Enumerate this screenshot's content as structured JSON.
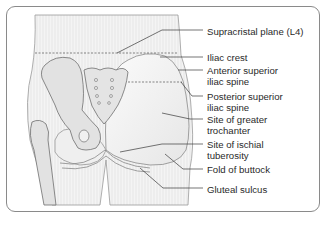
{
  "figure": {
    "labels": [
      {
        "id": "supracristal-plane",
        "lines": [
          "Supracristal plane (L4)"
        ]
      },
      {
        "id": "iliac-crest",
        "lines": [
          "Iliac crest"
        ]
      },
      {
        "id": "anterior-superior-iliac-spine",
        "lines": [
          "Anterior superior",
          "iliac spine"
        ]
      },
      {
        "id": "posterior-superior-iliac-spine",
        "lines": [
          "Posterior superior",
          "iliac spine"
        ]
      },
      {
        "id": "site-of-greater-trochanter",
        "lines": [
          "Site of greater",
          "trochanter"
        ]
      },
      {
        "id": "site-of-ischial-tuberosity",
        "lines": [
          "Site of ischial",
          "tuberosity"
        ]
      },
      {
        "id": "fold-of-buttock",
        "lines": [
          "Fold of buttock"
        ]
      },
      {
        "id": "gluteal-sulcus",
        "lines": [
          "Gluteal sulcus"
        ]
      }
    ]
  },
  "colors": {
    "frame": "#8a8a8a",
    "leader": "#3a3a3a",
    "text": "#2a2a2a",
    "skin": "#f2f2f2",
    "bone": "#dcdcdc"
  }
}
